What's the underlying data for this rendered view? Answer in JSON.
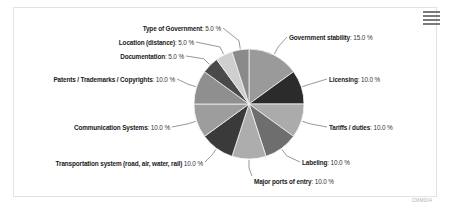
{
  "card": {
    "menu_icon": "hamburger-menu-icon",
    "credit": "CMM004"
  },
  "chart_data": {
    "type": "pie",
    "title": "",
    "legend_position": "callout-labels",
    "value_suffix": " %",
    "categories": [
      "Government stability",
      "Licensing",
      "Tariffs / duties",
      "Labeling",
      "Major ports of entry",
      "Transportation system (road, air, water, rail)",
      "Communication Systems",
      "Patents / Trademarks / Copyrights",
      "Documentation",
      "Location (distance)",
      "Type of Government"
    ],
    "values": [
      15.0,
      10.0,
      10.0,
      10.0,
      10.0,
      10.0,
      10.0,
      10.0,
      5.0,
      5.0,
      5.0
    ],
    "colors": [
      "#9a9a9a",
      "#2b2b2b",
      "#ababab",
      "#6e6e6e",
      "#adadad",
      "#3a3a3a",
      "#9d9d9d",
      "#8f8f8f",
      "#4a4a4a",
      "#cfcfcf",
      "#8a8a8a"
    ],
    "labels": [
      {
        "name": "Government stability",
        "value": "15.0 %"
      },
      {
        "name": "Licensing",
        "value": "10.0 %"
      },
      {
        "name": "Tariffs / duties",
        "value": "10.0 %"
      },
      {
        "name": "Labeling",
        "value": "10.0 %"
      },
      {
        "name": "Major ports of entry",
        "value": "10.0 %"
      },
      {
        "name": "Transportation system (road, air, water, rail)",
        "value": "10.0 %"
      },
      {
        "name": "Communication Systems",
        "value": "10.0 %"
      },
      {
        "name": "Patents / Trademarks / Copyrights",
        "value": "10.0 %"
      },
      {
        "name": "Documentation",
        "value": "5.0 %"
      },
      {
        "name": "Location (distance)",
        "value": "5.0 %"
      },
      {
        "name": "Type of Government",
        "value": "5.0 %"
      }
    ]
  }
}
